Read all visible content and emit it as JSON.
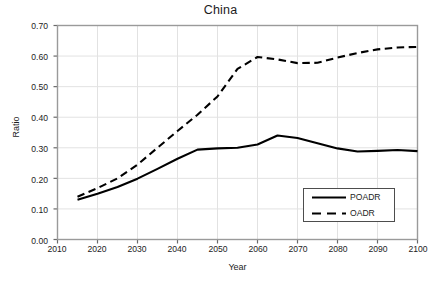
{
  "chart_data": {
    "type": "line",
    "title": "China",
    "xlabel": "Year",
    "ylabel": "Ratio",
    "xlim": [
      2010,
      2100
    ],
    "ylim": [
      0.0,
      0.7
    ],
    "grid": true,
    "legend_position": "lower right",
    "xticks": [
      2010,
      2020,
      2030,
      2040,
      2050,
      2060,
      2070,
      2080,
      2090,
      2100
    ],
    "xtick_labels": [
      "2010",
      "2020",
      "2030",
      "2040",
      "2050",
      "2060",
      "2070",
      "2080",
      "2090",
      "2100"
    ],
    "yticks": [
      0.0,
      0.1,
      0.2,
      0.3,
      0.4,
      0.5,
      0.6,
      0.7
    ],
    "ytick_labels": [
      "0.00",
      "0.10",
      "0.20",
      "0.30",
      "0.40",
      "0.50",
      "0.60",
      "0.70"
    ],
    "x": [
      2015,
      2020,
      2025,
      2030,
      2035,
      2040,
      2045,
      2050,
      2055,
      2060,
      2065,
      2070,
      2075,
      2080,
      2085,
      2090,
      2095,
      2100
    ],
    "series": [
      {
        "name": "POADR",
        "style": "solid",
        "color": "#000000",
        "values": [
          0.13,
          0.15,
          0.172,
          0.199,
          0.231,
          0.264,
          0.294,
          0.298,
          0.3,
          0.311,
          0.34,
          0.332,
          0.315,
          0.298,
          0.288,
          0.29,
          0.293,
          0.289
        ]
      },
      {
        "name": "OADR",
        "style": "dashed",
        "color": "#000000",
        "values": [
          0.14,
          0.168,
          0.2,
          0.245,
          0.3,
          0.355,
          0.408,
          0.468,
          0.558,
          0.597,
          0.589,
          0.577,
          0.578,
          0.595,
          0.61,
          0.622,
          0.628,
          0.63
        ]
      }
    ]
  },
  "legend": {
    "items": [
      {
        "label": "POADR",
        "style": "solid"
      },
      {
        "label": "OADR",
        "style": "dashed"
      }
    ]
  }
}
